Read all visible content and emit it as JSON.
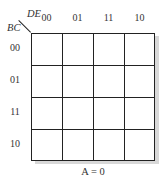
{
  "diagram": {
    "type": "karnaugh-map",
    "column_variables": "DE",
    "row_variables": "BC",
    "column_labels": [
      "00",
      "01",
      "11",
      "10"
    ],
    "row_labels": [
      "00",
      "01",
      "11",
      "10"
    ],
    "cells": [
      [
        "",
        "",
        "",
        ""
      ],
      [
        "",
        "",
        "",
        ""
      ],
      [
        "",
        "",
        "",
        ""
      ],
      [
        "",
        "",
        "",
        ""
      ]
    ],
    "caption": "A = 0"
  }
}
